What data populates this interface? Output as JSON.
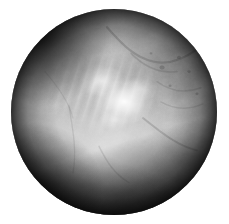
{
  "document": {
    "kind": "endoscopic-still-frame",
    "modality": "Arthroscopy / Endoscopy",
    "color_mode": "Grayscale",
    "alt_text": "Circular grayscale endoscopic view of soft tissue with a bright specular highlight near the centre, mottled tissue in the upper right, and a dark shadowed wedge across the lower left."
  },
  "canvas": {
    "width": 229,
    "height": 224,
    "background_color": "#ffffff"
  },
  "scope": {
    "shape": "circle",
    "center_x": 114,
    "center_y": 112,
    "radius": 103,
    "rim_color": "#1d1d1d"
  },
  "tones": {
    "highlight": "#ffffff",
    "bright_tissue": "#f2f2f2",
    "mid_tissue": "#b4b4b4",
    "dark_tissue": "#808080",
    "shadow": "#2e2e2e",
    "rim_vignette": "#101010"
  },
  "regions": [
    {
      "name": "specular-highlight",
      "label": "Specular highlight",
      "center_pct": [
        55,
        45
      ],
      "tone": "#ffffff"
    },
    {
      "name": "bright-tissue-band",
      "label": "Bright tissue band",
      "center_pct": [
        44,
        40
      ],
      "tone": "#e8e8e8"
    },
    {
      "name": "mottled-tissue-upper-right",
      "label": "Mottled tissue mass",
      "center_pct": [
        78,
        30
      ],
      "tone": "#808080"
    },
    {
      "name": "smooth-tissue-left",
      "label": "Smooth tissue surface",
      "center_pct": [
        26,
        62
      ],
      "tone": "#b4b4b4"
    },
    {
      "name": "shadow-wedge-lower-left",
      "label": "Shadowed recess",
      "center_pct": [
        22,
        86
      ],
      "tone": "#2e2e2e"
    },
    {
      "name": "rim-vignette",
      "label": "Aperture vignette",
      "center_pct": [
        50,
        50
      ],
      "tone": "#101010"
    }
  ]
}
